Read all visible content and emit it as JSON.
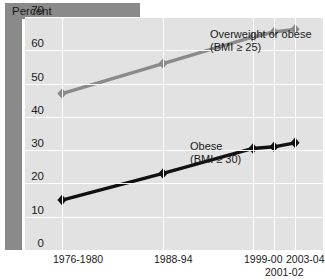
{
  "header": {
    "title": "Percent"
  },
  "chart_data": {
    "type": "line",
    "title": "Percent",
    "xlabel": "",
    "ylabel": "Percent",
    "ylim": [
      0,
      70
    ],
    "yticks": [
      0,
      10,
      20,
      30,
      40,
      50,
      60,
      70
    ],
    "ytick_labels": [
      "0",
      "10",
      "20",
      "30",
      "40",
      "50",
      "60",
      "70"
    ],
    "grid": true,
    "legend": "inline-annotations",
    "categories": [
      "1976-1980",
      "1988-94",
      "1999-00",
      "2001-02",
      "2003-04"
    ],
    "xtick_labels": [
      {
        "text": "1976-1980",
        "row": 1
      },
      {
        "text": "1988-94",
        "row": 1
      },
      {
        "text": "1999-00",
        "row": 1
      },
      {
        "text": "2001-02",
        "row": 2
      },
      {
        "text": "2003-04",
        "row": 1
      }
    ],
    "series": [
      {
        "name": "Overweight or obese (BMI ≥ 25)",
        "label_line1": "Overweight or obese",
        "label_line2": "(BMI ≥ 25)",
        "color": "#8a8a8a",
        "marker": "diamond",
        "values": [
          47,
          56,
          64,
          65.5,
          66.3
        ]
      },
      {
        "name": "Obese (BMI ≥ 30)",
        "label_line1": "Obese",
        "label_line2": "(BMI ≥ 30)",
        "color": "#111111",
        "marker": "diamond",
        "values": [
          15,
          23,
          30.5,
          31,
          32.2
        ]
      }
    ]
  },
  "colors": {
    "panel_background": "#e2e2e2",
    "grid": "#ffffff",
    "bar_grey": "#8a8a8a",
    "series_overweight": "#8a8a8a",
    "series_obese": "#111111",
    "text": "#1a1a1a"
  }
}
